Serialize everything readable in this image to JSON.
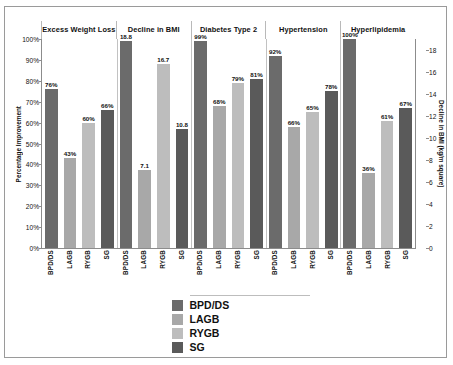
{
  "chart_data": {
    "type": "bar",
    "title": "",
    "xlabel": "",
    "ylabel": "Percentage Improvement",
    "y2label": "Decline in BMI (kg/m square)",
    "ylim": [
      0,
      100
    ],
    "y2lim": [
      0,
      19
    ],
    "yticks": [
      "0%",
      "10%",
      "20%",
      "30%",
      "40%",
      "50%",
      "60%",
      "70%",
      "80%",
      "90%",
      "100%"
    ],
    "y2ticks": [
      "0",
      "2",
      "4",
      "6",
      "8",
      "10",
      "12",
      "14",
      "16",
      "18"
    ],
    "grid": false,
    "legend_position": "bottom",
    "groups": [
      "Excess Weight Loss",
      "Decline in BMI",
      "Diabetes Type 2",
      "Hypertension",
      "Hyperlipidemia"
    ],
    "categories": [
      "BPD/DS",
      "LAGB",
      "RYGB",
      "SG"
    ],
    "series": [
      {
        "name": "BPD/DS",
        "color": "#6b6b6b"
      },
      {
        "name": "LAGB",
        "color": "#a8a8a8"
      },
      {
        "name": "RYGB",
        "color": "#bdbdbd"
      },
      {
        "name": "SG",
        "color": "#5a5a5a"
      }
    ],
    "bars": [
      {
        "group": "Excess Weight Loss",
        "category": "BPD/DS",
        "label": "76%",
        "value": 76,
        "axis": "left"
      },
      {
        "group": "Excess Weight Loss",
        "category": "LAGB",
        "label": "43%",
        "value": 43,
        "axis": "left"
      },
      {
        "group": "Excess Weight Loss",
        "category": "RYGB",
        "label": "60%",
        "value": 60,
        "axis": "left"
      },
      {
        "group": "Excess Weight Loss",
        "category": "SG",
        "label": "66%",
        "value": 66,
        "axis": "left"
      },
      {
        "group": "Decline in BMI",
        "category": "BPD/DS",
        "label": "18.8",
        "value": 18.8,
        "axis": "right"
      },
      {
        "group": "Decline in BMI",
        "category": "LAGB",
        "label": "7.1",
        "value": 7.1,
        "axis": "right"
      },
      {
        "group": "Decline in BMI",
        "category": "RYGB",
        "label": "16.7",
        "value": 16.7,
        "axis": "right"
      },
      {
        "group": "Decline in BMI",
        "category": "SG",
        "label": "10.8",
        "value": 10.8,
        "axis": "right"
      },
      {
        "group": "Diabetes Type 2",
        "category": "BPD/DS",
        "label": "99%",
        "value": 99,
        "axis": "left"
      },
      {
        "group": "Diabetes Type 2",
        "category": "LAGB",
        "label": "68%",
        "value": 68,
        "axis": "left"
      },
      {
        "group": "Diabetes Type 2",
        "category": "RYGB",
        "label": "79%",
        "value": 79,
        "axis": "left"
      },
      {
        "group": "Diabetes Type 2",
        "category": "SG",
        "label": "81%",
        "value": 81,
        "axis": "left"
      },
      {
        "group": "Hypertension",
        "category": "BPD/DS",
        "label": "92%",
        "value": 92,
        "axis": "left"
      },
      {
        "group": "Hypertension",
        "category": "LAGB",
        "label": "66%",
        "value": 58,
        "axis": "left"
      },
      {
        "group": "Hypertension",
        "category": "RYGB",
        "label": "65%",
        "value": 65,
        "axis": "left"
      },
      {
        "group": "Hypertension",
        "category": "SG",
        "label": "78%",
        "value": 75,
        "axis": "left"
      },
      {
        "group": "Hyperlipidemia",
        "category": "BPD/DS",
        "label": "100%",
        "value": 100,
        "axis": "left"
      },
      {
        "group": "Hyperlipidemia",
        "category": "LAGB",
        "label": "36%",
        "value": 36,
        "axis": "left"
      },
      {
        "group": "Hyperlipidemia",
        "category": "RYGB",
        "label": "61%",
        "value": 61,
        "axis": "left"
      },
      {
        "group": "Hyperlipidemia",
        "category": "SG",
        "label": "67%",
        "value": 67,
        "axis": "left"
      }
    ]
  }
}
